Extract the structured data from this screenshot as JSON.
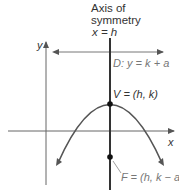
{
  "diagram": {
    "title_lines": [
      "Axis of",
      "symmetry",
      "x = h"
    ],
    "axes": {
      "x_label": "x",
      "y_label": "y"
    },
    "directrix_label": "D: y = k + a",
    "vertex_label": "V = (h, k)",
    "focus_label": "F = (h, k − a)",
    "colors": {
      "axis_of_symmetry": "#333333",
      "axes": "#555555",
      "parabola": "#555555",
      "directrix": "#666666",
      "points": "#111111"
    }
  }
}
